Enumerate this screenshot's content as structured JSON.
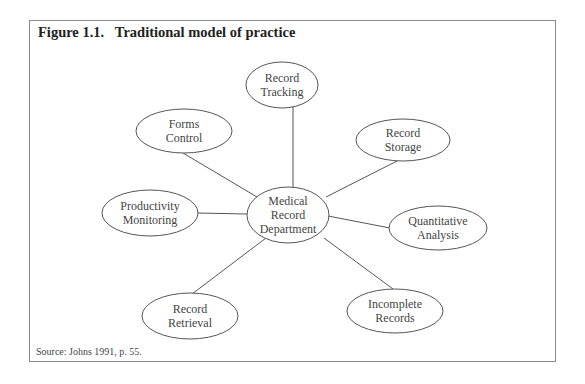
{
  "figure": {
    "title": "Figure 1.1.   Traditional model of practice",
    "source": "Source: Johns 1991, p. 55."
  },
  "diagram": {
    "center": {
      "id": "center",
      "lines": [
        "Medical",
        "Record",
        "Department"
      ],
      "cx": 288,
      "cy": 215,
      "rx": 41,
      "ry": 28
    },
    "nodes": [
      {
        "id": "tracking",
        "lines": [
          "Record",
          "Tracking"
        ],
        "cx": 282,
        "cy": 85,
        "rx": 36,
        "ry": 23
      },
      {
        "id": "storage",
        "lines": [
          "Record",
          "Storage"
        ],
        "cx": 403,
        "cy": 140,
        "rx": 47,
        "ry": 21
      },
      {
        "id": "quantitative",
        "lines": [
          "Quantitative",
          "Analysis"
        ],
        "cx": 438,
        "cy": 228,
        "rx": 49,
        "ry": 22
      },
      {
        "id": "incomplete",
        "lines": [
          "Incomplete",
          "Records"
        ],
        "cx": 395,
        "cy": 311,
        "rx": 48,
        "ry": 22
      },
      {
        "id": "retrieval",
        "lines": [
          "Record",
          "Retrieval"
        ],
        "cx": 190,
        "cy": 316,
        "rx": 48,
        "ry": 23
      },
      {
        "id": "productivity",
        "lines": [
          "Productivity",
          "Monitoring"
        ],
        "cx": 150,
        "cy": 213,
        "rx": 48,
        "ry": 23
      },
      {
        "id": "forms",
        "lines": [
          "Forms",
          "Control"
        ],
        "cx": 184,
        "cy": 131,
        "rx": 48,
        "ry": 22
      }
    ],
    "edges": [
      {
        "to": "tracking",
        "x1": 293,
        "y1": 187,
        "x2": 293,
        "y2": 107
      },
      {
        "to": "storage",
        "x1": 326,
        "y1": 197,
        "x2": 399,
        "y2": 160
      },
      {
        "to": "quantitative",
        "x1": 328,
        "y1": 216,
        "x2": 390,
        "y2": 228
      },
      {
        "to": "incomplete",
        "x1": 324,
        "y1": 238,
        "x2": 393,
        "y2": 289
      },
      {
        "to": "retrieval",
        "x1": 266,
        "y1": 238,
        "x2": 192,
        "y2": 294
      },
      {
        "to": "productivity",
        "x1": 198,
        "y1": 213,
        "x2": 247,
        "y2": 214
      },
      {
        "to": "forms",
        "x1": 183,
        "y1": 153,
        "x2": 262,
        "y2": 200
      }
    ]
  }
}
